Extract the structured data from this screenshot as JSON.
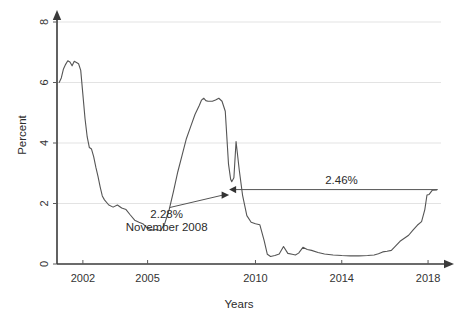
{
  "chart_data": {
    "type": "line",
    "title": "",
    "subtitle": "",
    "xlabel": "Years",
    "ylabel": "Percent",
    "xlim": [
      2000.8,
      2018.6
    ],
    "ylim": [
      0,
      8
    ],
    "grid": true,
    "legend": null,
    "legend_position": "none",
    "x_ticks": [
      2002,
      2005,
      2010,
      2014,
      2018
    ],
    "x_tick_labels": [
      "2002",
      "2005",
      "2010",
      "2014",
      "2018"
    ],
    "y_ticks": [
      0,
      2,
      4,
      6,
      8
    ],
    "y_tick_labels": [
      "0",
      "2",
      "4",
      "6",
      "8"
    ],
    "series": [
      {
        "name": "rate",
        "x": [
          2000.9,
          2001.0,
          2001.1,
          2001.2,
          2001.3,
          2001.4,
          2001.5,
          2001.6,
          2001.7,
          2001.8,
          2001.9,
          2002.0,
          2002.1,
          2002.2,
          2002.3,
          2002.4,
          2002.5,
          2002.6,
          2002.7,
          2002.8,
          2002.9,
          2003.0,
          2003.2,
          2003.4,
          2003.6,
          2003.8,
          2004.0,
          2004.2,
          2004.4,
          2004.6,
          2004.8,
          2005.0,
          2005.2,
          2005.4,
          2005.6,
          2005.8,
          2006.0,
          2006.2,
          2006.4,
          2006.6,
          2006.8,
          2007.0,
          2007.2,
          2007.4,
          2007.5,
          2007.6,
          2007.7,
          2007.8,
          2007.9,
          2008.0,
          2008.15,
          2008.3,
          2008.45,
          2008.6,
          2008.75,
          2008.85,
          2008.9,
          2009.0,
          2009.1,
          2009.25,
          2009.4,
          2009.6,
          2009.8,
          2010.0,
          2010.2,
          2010.4,
          2010.55,
          2010.7,
          2010.9,
          2011.1,
          2011.3,
          2011.5,
          2011.7,
          2011.85,
          2012.0,
          2012.2,
          2012.4,
          2012.6,
          2012.9,
          2013.2,
          2013.6,
          2014.0,
          2014.4,
          2014.8,
          2015.2,
          2015.5,
          2015.7,
          2015.9,
          2016.1,
          2016.3,
          2016.5,
          2016.7,
          2016.9,
          2017.1,
          2017.3,
          2017.5,
          2017.7,
          2017.85,
          2017.95,
          2018.05,
          2018.2,
          2018.4
        ],
        "y": [
          6.0,
          6.15,
          6.45,
          6.6,
          6.72,
          6.68,
          6.55,
          6.7,
          6.66,
          6.62,
          6.4,
          5.6,
          4.8,
          4.2,
          3.85,
          3.8,
          3.55,
          3.2,
          2.9,
          2.55,
          2.25,
          2.12,
          1.95,
          1.88,
          1.95,
          1.85,
          1.8,
          1.62,
          1.45,
          1.38,
          1.32,
          1.18,
          1.12,
          1.14,
          1.1,
          1.35,
          1.8,
          2.4,
          3.05,
          3.6,
          4.15,
          4.55,
          4.95,
          5.25,
          5.42,
          5.48,
          5.4,
          5.38,
          5.38,
          5.38,
          5.42,
          5.48,
          5.38,
          5.05,
          3.3,
          2.8,
          2.72,
          2.85,
          4.05,
          3.1,
          2.28,
          1.6,
          1.38,
          1.33,
          1.3,
          0.78,
          0.32,
          0.25,
          0.28,
          0.33,
          0.58,
          0.35,
          0.32,
          0.3,
          0.36,
          0.55,
          0.48,
          0.45,
          0.38,
          0.33,
          0.3,
          0.28,
          0.27,
          0.27,
          0.28,
          0.3,
          0.34,
          0.4,
          0.42,
          0.45,
          0.6,
          0.75,
          0.85,
          0.95,
          1.12,
          1.28,
          1.4,
          1.8,
          2.28,
          2.3,
          2.44,
          2.45
        ]
      }
    ],
    "annotations": [
      {
        "id": "low-point",
        "label_line1": "2.28%",
        "label_line2": "November 2008",
        "point_x": 2008.78,
        "point_y": 2.28,
        "text_x": 2006.3,
        "text_y": 1.8,
        "arrow": true
      },
      {
        "id": "span-level",
        "label": "2.46%",
        "from_x": 2008.78,
        "to_x": 2018.45,
        "level_y": 2.46,
        "arrow": true
      }
    ]
  },
  "axes": {
    "y_label": "Percent",
    "x_label": "Years"
  },
  "colors": {
    "background": "#ffffff",
    "series": "#555555",
    "axis": "#3a3a3a",
    "grid": "#dcdcdc",
    "text": "#2b2b2b"
  }
}
